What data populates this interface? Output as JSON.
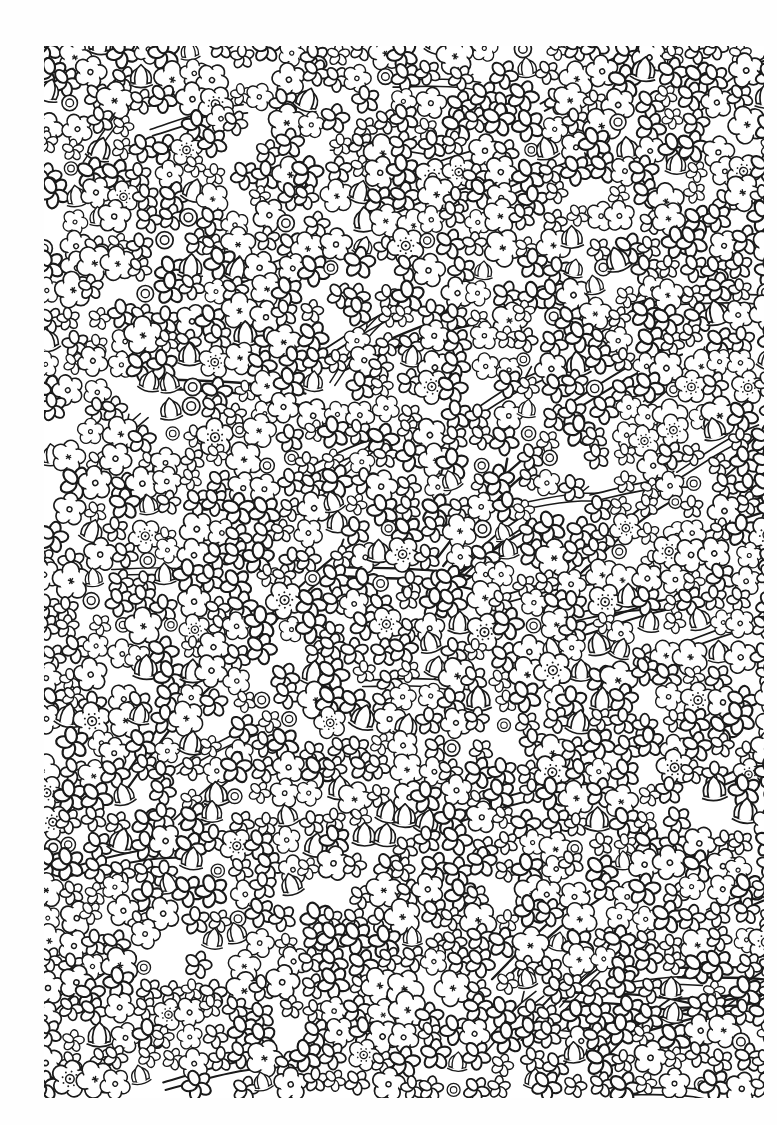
{
  "page": {
    "type": "coloring-page",
    "background_color": "#ffffff",
    "line_color": "#1a1a1a"
  },
  "artwork": {
    "left": 44,
    "top": 46,
    "width": 720,
    "height": 1052,
    "elements": [
      "five-petal flowers",
      "asterisk-center flowers",
      "dotted-center flowers",
      "tulip buds",
      "branches"
    ]
  }
}
